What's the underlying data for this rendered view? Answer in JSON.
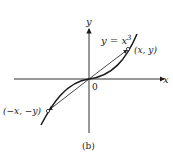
{
  "figure": {
    "caption": "(b)",
    "equation_lhs": "y = x",
    "equation_exp": "3",
    "axis_x_label": "x",
    "axis_y_label": "y",
    "origin_label": "0",
    "point_pos_label": "(x, y)",
    "point_neg_label": "(−x, −y)"
  },
  "colors": {
    "ink": "#1a1a1a",
    "background": "#ffffff"
  }
}
